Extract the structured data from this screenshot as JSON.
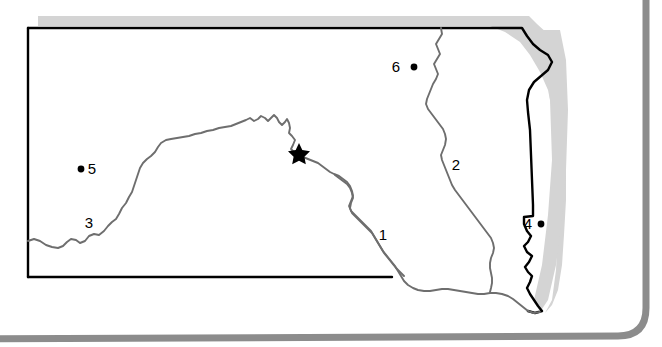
{
  "figure": {
    "type": "reference-map",
    "background_color": "#ffffff"
  },
  "frame": {
    "outer_border_name": "rounded-panel-frame",
    "outer_border_color": "#8c8c8c",
    "state_border_color": "#000000",
    "state_shadow_color": "#d4d4d4",
    "river_color": "#6e6e6e"
  },
  "map": {
    "state_outline_name": "state-boundary",
    "rivers": [
      {
        "id": "river-1",
        "label": "1"
      },
      {
        "id": "river-2",
        "label": "2"
      },
      {
        "id": "river-3",
        "label": "3"
      }
    ],
    "river_labels": [
      {
        "label": "1",
        "x": 383,
        "y": 240
      },
      {
        "label": "2",
        "x": 456,
        "y": 170
      },
      {
        "label": "3",
        "x": 89,
        "y": 228
      }
    ],
    "site_markers": [
      {
        "label": "4",
        "label_x": 528,
        "label_y": 229,
        "dot_x": 541,
        "dot_y": 224,
        "label_side": "left"
      },
      {
        "label": "5",
        "label_x": 92,
        "label_y": 174,
        "dot_x": 81,
        "dot_y": 169,
        "label_side": "right"
      },
      {
        "label": "6",
        "label_x": 396,
        "label_y": 72,
        "dot_x": 414,
        "dot_y": 67,
        "label_side": "left"
      }
    ],
    "star_marker": {
      "name": "capital-star",
      "x": 299,
      "y": 152
    }
  },
  "colors": {
    "black": "#000000",
    "gray_frame": "#8c8c8c",
    "gray_shadow": "#d4d4d4",
    "river_gray": "#6e6e6e",
    "white": "#ffffff"
  }
}
